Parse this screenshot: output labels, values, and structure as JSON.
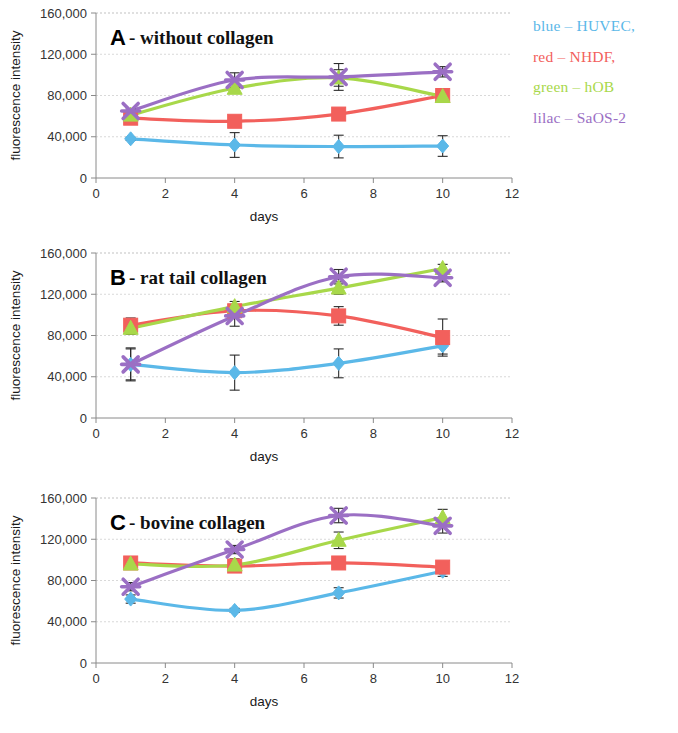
{
  "figure": {
    "legend": {
      "items": [
        {
          "label": "blue – HUVEC,",
          "color": "#5bb8e8",
          "series": "HUVEC"
        },
        {
          "label": "red – NHDF,",
          "color": "#f2605c",
          "series": "NHDF"
        },
        {
          "label": "green – hOB",
          "color": "#a8d84a",
          "series": "hOB"
        },
        {
          "label": "lilac – SaOS-2",
          "color": "#9b6fc4",
          "series": "SaOS-2"
        }
      ]
    },
    "axis": {
      "xlabel": "days",
      "ylabel": "fluorescence intensity",
      "xticks": [
        "0",
        "2",
        "4",
        "6",
        "8",
        "10",
        "12"
      ],
      "yticks": [
        "0",
        "40,000",
        "80,000",
        "120,000",
        "160,000"
      ]
    }
  },
  "chart_data": [
    {
      "type": "line",
      "panel": "A",
      "letter": "A",
      "title": "- without collagen",
      "xlabel": "days",
      "ylabel": "fluorescence intensity",
      "x": [
        1,
        4,
        7,
        10
      ],
      "xlim": [
        0,
        12
      ],
      "ylim": [
        0,
        160000
      ],
      "xticks": [
        0,
        2,
        4,
        6,
        8,
        10,
        12
      ],
      "yticks": [
        0,
        40000,
        80000,
        120000,
        160000
      ],
      "grid": true,
      "legend_position": "outside-right",
      "series": [
        {
          "name": "HUVEC",
          "color": "#5bb8e8",
          "marker": "diamond",
          "values": [
            38000,
            32000,
            30500,
            31000
          ],
          "errors": [
            1500,
            12000,
            11000,
            10000
          ]
        },
        {
          "name": "NHDF",
          "color": "#f2605c",
          "marker": "square",
          "values": [
            58000,
            55000,
            62000,
            80000
          ],
          "errors": [
            2500,
            2500,
            3000,
            4000
          ]
        },
        {
          "name": "hOB",
          "color": "#a8d84a",
          "marker": "triangle",
          "values": [
            61000,
            87000,
            97000,
            79000
          ],
          "errors": [
            2000,
            4000,
            8000,
            3000
          ]
        },
        {
          "name": "SaOS-2",
          "color": "#9b6fc4",
          "marker": "cross",
          "values": [
            65000,
            95000,
            98000,
            103000
          ],
          "errors": [
            2000,
            7000,
            13000,
            5000
          ]
        }
      ]
    },
    {
      "type": "line",
      "panel": "B",
      "letter": "B",
      "title": "- rat tail collagen",
      "xlabel": "days",
      "ylabel": "fluorescence intensity",
      "x": [
        1,
        4,
        7,
        10
      ],
      "xlim": [
        0,
        12
      ],
      "ylim": [
        0,
        160000
      ],
      "xticks": [
        0,
        2,
        4,
        6,
        8,
        10,
        12
      ],
      "yticks": [
        0,
        40000,
        80000,
        120000,
        160000
      ],
      "grid": true,
      "legend_position": "outside-right",
      "series": [
        {
          "name": "HUVEC",
          "color": "#5bb8e8",
          "marker": "diamond",
          "values": [
            52000,
            44000,
            53000,
            70000
          ],
          "errors": [
            16000,
            17000,
            14000,
            8000
          ]
        },
        {
          "name": "NHDF",
          "color": "#f2605c",
          "marker": "square",
          "values": [
            90000,
            104000,
            99000,
            78000
          ],
          "errors": [
            7000,
            6000,
            9000,
            18000
          ]
        },
        {
          "name": "hOB",
          "color": "#a8d84a",
          "marker": "triangle",
          "values": [
            87000,
            108000,
            126000,
            145000
          ],
          "errors": [
            6000,
            5000,
            6000,
            4000
          ]
        },
        {
          "name": "SaOS-2",
          "color": "#9b6fc4",
          "marker": "cross",
          "values": [
            52000,
            99000,
            137000,
            136000
          ],
          "errors": [
            15000,
            10000,
            7000,
            4000
          ]
        }
      ]
    },
    {
      "type": "line",
      "panel": "C",
      "letter": "C",
      "title": "- bovine collagen",
      "xlabel": "days",
      "ylabel": "fluorescence intensity",
      "x": [
        1,
        4,
        7,
        10
      ],
      "xlim": [
        0,
        12
      ],
      "ylim": [
        0,
        160000
      ],
      "xticks": [
        0,
        2,
        4,
        6,
        8,
        10,
        12
      ],
      "yticks": [
        0,
        40000,
        80000,
        120000,
        160000
      ],
      "grid": true,
      "legend_position": "outside-right",
      "series": [
        {
          "name": "HUVEC",
          "color": "#5bb8e8",
          "marker": "diamond",
          "values": [
            62000,
            51000,
            68000,
            89000
          ],
          "errors": [
            4000,
            2000,
            5000,
            5000
          ]
        },
        {
          "name": "NHDF",
          "color": "#f2605c",
          "marker": "square",
          "values": [
            97000,
            94000,
            97000,
            93000
          ],
          "errors": [
            3000,
            2500,
            4000,
            4000
          ]
        },
        {
          "name": "hOB",
          "color": "#a8d84a",
          "marker": "triangle",
          "values": [
            96000,
            95000,
            119000,
            141000
          ],
          "errors": [
            3000,
            6000,
            8000,
            8000
          ]
        },
        {
          "name": "SaOS-2",
          "color": "#9b6fc4",
          "marker": "cross",
          "values": [
            74000,
            110000,
            143000,
            133000
          ],
          "errors": [
            4000,
            4000,
            7000,
            7000
          ]
        }
      ]
    }
  ]
}
